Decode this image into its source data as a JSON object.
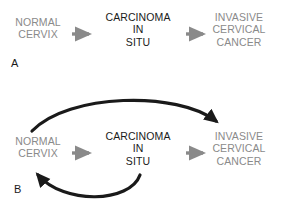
{
  "figure": {
    "background_color": "#ffffff",
    "width": 283,
    "height": 209,
    "muted_color": "#8a8a8a",
    "strong_color": "#1a1a1a"
  },
  "panels": [
    {
      "letter": "A",
      "nodes": {
        "normal_cervix": "NORMAL\nCERVIX",
        "carcinoma_in_situ": "CARCINOMA\nIN\nSITU",
        "invasive_cancer": "INVASIVE\nCERVICAL\nCANCER"
      },
      "arrows": [
        {
          "name": "normal-to-cis",
          "style": "straight",
          "color": "#8a8a8a"
        },
        {
          "name": "cis-to-invasive",
          "style": "straight",
          "color": "#8a8a8a"
        }
      ]
    },
    {
      "letter": "B",
      "nodes": {
        "normal_cervix": "NORMAL\nCERVIX",
        "carcinoma_in_situ": "CARCINOMA\nIN\nSITU",
        "invasive_cancer": "INVASIVE\nCERVICAL\nCANCER"
      },
      "arrows": [
        {
          "name": "normal-to-cis",
          "style": "straight",
          "color": "#8a8a8a"
        },
        {
          "name": "cis-to-invasive",
          "style": "straight",
          "color": "#8a8a8a"
        },
        {
          "name": "normal-to-invasive-bypass",
          "style": "curved-over",
          "color": "#1a1a1a"
        },
        {
          "name": "cis-to-normal-regression",
          "style": "curved-under",
          "color": "#1a1a1a"
        }
      ]
    }
  ]
}
